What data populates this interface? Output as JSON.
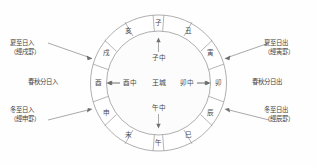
{
  "figure": {
    "center_label": "王城",
    "ring": {
      "branches": [
        {
          "id": "zi",
          "char": "子",
          "position": "top"
        },
        {
          "id": "chou",
          "char": "丑",
          "position": "top-right"
        },
        {
          "id": "yin",
          "char": "寅",
          "position": "upper-right"
        },
        {
          "id": "mao",
          "char": "卯",
          "position": "right"
        },
        {
          "id": "chen",
          "char": "辰",
          "position": "lower-right"
        },
        {
          "id": "si",
          "char": "巳",
          "position": "bottom-right"
        },
        {
          "id": "wu",
          "char": "午",
          "position": "bottom"
        },
        {
          "id": "wei",
          "char": "未",
          "position": "bottom-left"
        },
        {
          "id": "shen",
          "char": "申",
          "position": "lower-left"
        },
        {
          "id": "you",
          "char": "酉",
          "position": "left"
        },
        {
          "id": "xu",
          "char": "戌",
          "position": "upper-left"
        },
        {
          "id": "hai",
          "char": "亥",
          "position": "top-left"
        }
      ]
    },
    "inner_marks": [
      {
        "id": "zi-zhong",
        "char": "子中",
        "position": "top"
      },
      {
        "id": "mao-zhong",
        "char": "卯中",
        "position": "right"
      },
      {
        "id": "wu-zhong",
        "char": "午中",
        "position": "bottom"
      },
      {
        "id": "you-zhong",
        "char": "酉中",
        "position": "left"
      }
    ],
    "annotations": [
      {
        "id": "summer-solstice-sunset",
        "line1": "夏至日入",
        "line2": "（經戌罫）",
        "side": "top-left"
      },
      {
        "id": "summer-solstice-sunrise",
        "line1": "夏至日出",
        "line2": "（經寅罫）",
        "side": "top-right"
      },
      {
        "id": "equinox-sunset",
        "line1": "春秋分日入",
        "line2": "",
        "side": "middle-left"
      },
      {
        "id": "equinox-sunrise",
        "line1": "春秋分日出",
        "line2": "",
        "side": "middle-right"
      },
      {
        "id": "winter-solstice-sunset",
        "line1": "冬至日入",
        "line2": "（經申罫）",
        "side": "bottom-left"
      },
      {
        "id": "winter-solstice-sunrise",
        "line1": "冬至日出",
        "line2": "（經辰罫）",
        "side": "bottom-right"
      }
    ],
    "colors": {
      "stroke": "#8d8d8d",
      "text": "#3f3f3f",
      "background": "#fefefe"
    }
  }
}
